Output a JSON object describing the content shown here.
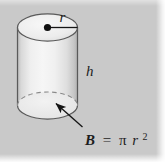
{
  "figure": {
    "kind": "geometry-diagram",
    "shape": "cylinder",
    "background_color": "#c9c9c9",
    "outline_color": "#555555",
    "ink_color": "#1d1d1d",
    "top_face_fill": "#efefef",
    "body_fill_light": "#f2f2f2",
    "body_fill_shadow": "#c4c4c4",
    "labels": {
      "radius": "r",
      "height": "h"
    },
    "formula": {
      "variable": "B",
      "equals": "=",
      "pi": "π",
      "radius": "r",
      "exponent": "2",
      "full_text": "B = πr²"
    },
    "annotations": {
      "radius_line": "radius-segment-from-center-to-edge",
      "center_dot": "center-point",
      "base_arrow": "arrow-pointing-to-base",
      "hidden_base_arc": "dashed-hidden-edge"
    }
  }
}
